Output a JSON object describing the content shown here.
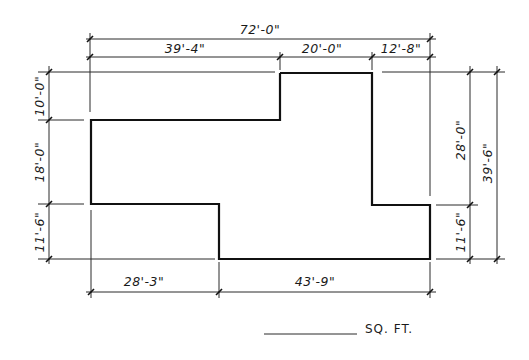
{
  "diagram": {
    "type": "floor-plan-footprint",
    "colors": {
      "ink": "#111111",
      "background": "#ffffff"
    },
    "dimensions": {
      "top_overall": "72'-0\"",
      "top_segments": [
        "39'-4\"",
        "20'-0\"",
        "12'-8\""
      ],
      "left_segments": [
        "10'-0\"",
        "18'-0\"",
        "11'-6\""
      ],
      "right_segments": [
        "28'-0\"",
        "11'-6\""
      ],
      "right_overall": "39'-6\"",
      "bottom_segments": [
        "28'-3\"",
        "43'-9\""
      ]
    },
    "area": {
      "value": "",
      "unit_label": "SQ. FT."
    }
  }
}
